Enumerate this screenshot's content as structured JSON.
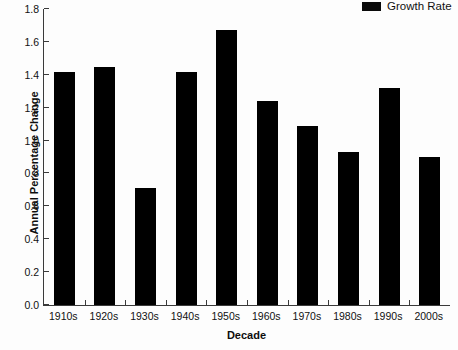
{
  "chart_data": {
    "type": "bar",
    "title": "",
    "xlabel": "Decade",
    "ylabel": "Annual Percentage Change",
    "categories": [
      "1910s",
      "1920s",
      "1930s",
      "1940s",
      "1950s",
      "1960s",
      "1970s",
      "1980s",
      "1990s",
      "2000s"
    ],
    "values": [
      1.42,
      1.45,
      0.71,
      1.42,
      1.67,
      1.24,
      1.09,
      0.93,
      1.32,
      0.9
    ],
    "series": [
      {
        "name": "Growth Rate",
        "values": [
          1.42,
          1.45,
          0.71,
          1.42,
          1.67,
          1.24,
          1.09,
          0.93,
          1.32,
          0.9
        ]
      }
    ],
    "ylim": [
      0.0,
      1.8
    ],
    "ytick_labels": [
      "0.0",
      "0.2",
      "0.4",
      "0.6",
      "0.8",
      "1.0",
      "1.2",
      "1.4",
      "1.6",
      "1.8"
    ],
    "ytick_values": [
      0.0,
      0.2,
      0.4,
      0.6,
      0.8,
      1.0,
      1.2,
      1.4,
      1.6,
      1.8
    ],
    "grid": false,
    "legend": {
      "position": "top-right",
      "entries": [
        {
          "label": "Growth Rate",
          "color": "#000000"
        }
      ]
    },
    "bar_color": "#000000",
    "axis_color": "#3a3a3a",
    "background_color": "#fdfdfd"
  }
}
